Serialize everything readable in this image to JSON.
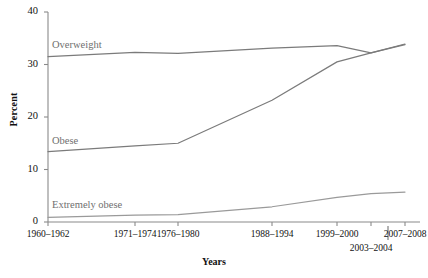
{
  "chart_data": {
    "type": "line",
    "title": "",
    "xlabel": "Years",
    "ylabel": "Percent",
    "ylim": [
      0,
      40
    ],
    "yticks": [
      0,
      10,
      20,
      30,
      40
    ],
    "grid": false,
    "legend": "inline-labels",
    "categories": [
      "1960–1962",
      "1971–1974",
      "1976–1980",
      "1988–1994",
      "1999–2000",
      "2003–2004",
      "2007–2008"
    ],
    "series": [
      {
        "name": "Overweight",
        "color": "#7b7b7b",
        "values": [
          31.5,
          32.3,
          32.1,
          33.1,
          33.6,
          32.2,
          33.8
        ]
      },
      {
        "name": "Obese",
        "color": "#7b7b7b",
        "values": [
          13.4,
          14.5,
          15.0,
          23.2,
          30.5,
          32.2,
          33.9
        ]
      },
      {
        "name": "Extremely obese",
        "color": "#9a9a9a",
        "values": [
          0.9,
          1.3,
          1.4,
          2.9,
          4.7,
          5.4,
          5.7
        ]
      }
    ],
    "series_label_positions": [
      {
        "name": "Overweight",
        "left": 52,
        "top": 39
      },
      {
        "name": "Obese",
        "left": 52,
        "top": 135
      },
      {
        "name": "Extremely obese",
        "left": 52,
        "top": 199
      }
    ],
    "xtick_offsets": [
      0,
      0,
      0,
      0,
      0,
      14,
      0
    ],
    "axis_color": "#8a8a8a"
  },
  "axes": {
    "ytick_labels": [
      "40",
      "30",
      "20",
      "10",
      "0"
    ],
    "xtick_labels": [
      "1960–1962",
      "1971–1974",
      "1976–1980",
      "1988–1994",
      "1999–2000",
      "2003–2004",
      "2007–2008"
    ],
    "y_axis_title": "Percent",
    "x_axis_title": "Years"
  },
  "footer": {
    "note": ""
  }
}
